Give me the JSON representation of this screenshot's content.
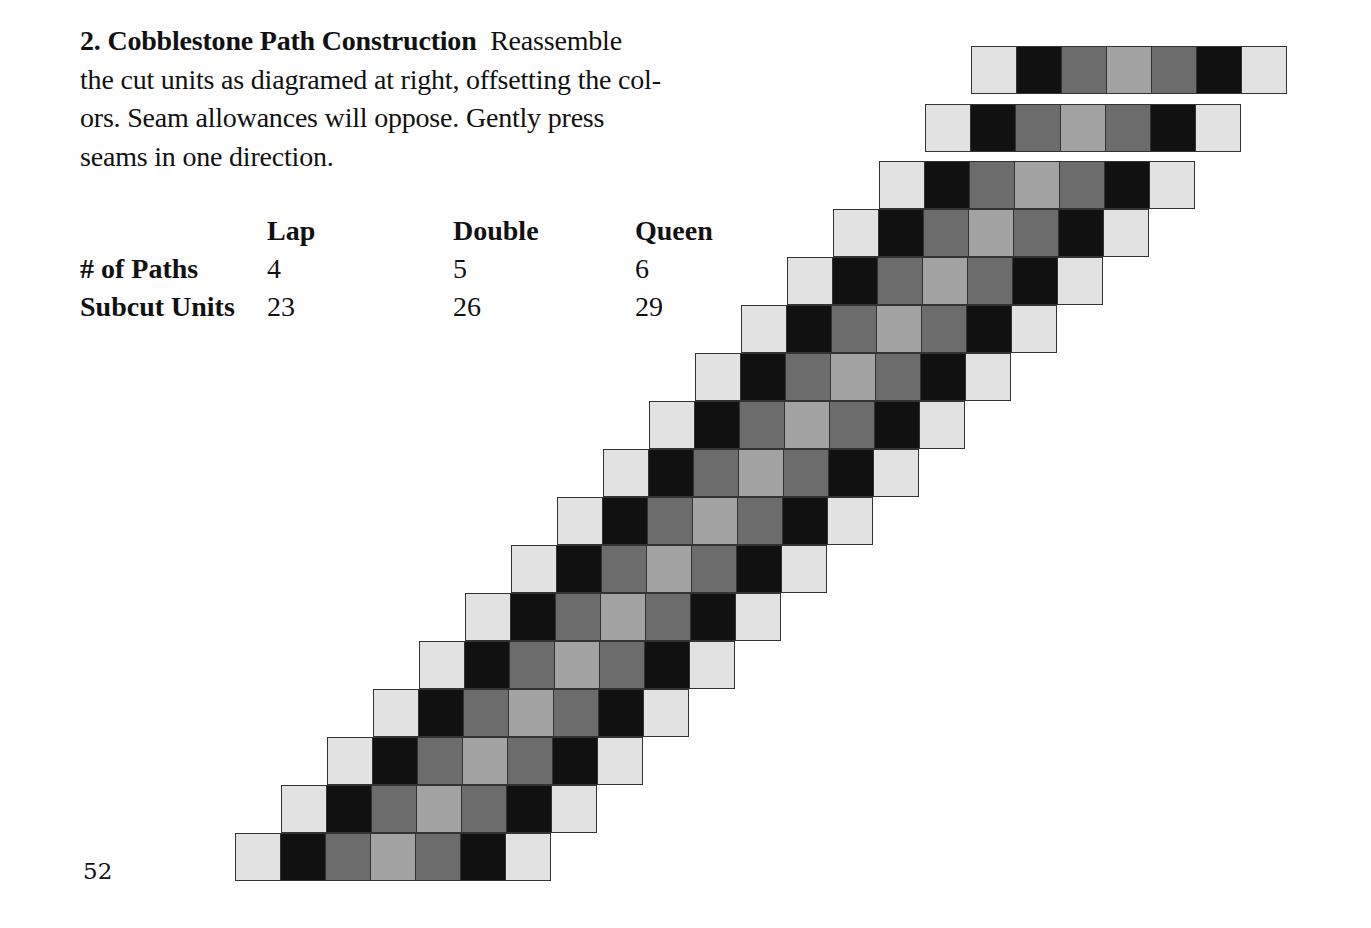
{
  "section": {
    "heading": "2.  Cobblestone Path Construction",
    "body": "Reassemble the cut units as diagramed at right, offsetting the colors.  Seam allowances will oppose.  Gently press seams in one direction.",
    "lines": [
      "Reassemble",
      "the cut units as diagramed at right, offsetting the col-",
      "ors.  Seam allowances will oppose.  Gently press",
      "seams in one direction."
    ]
  },
  "table": {
    "columns": [
      "Lap",
      "Double",
      "Queen"
    ],
    "rows": [
      {
        "label": "# of Paths",
        "values": [
          "4",
          "5",
          "6"
        ]
      },
      {
        "label": "Subcut Units",
        "values": [
          "23",
          "26",
          "29"
        ]
      }
    ]
  },
  "page_number": "52",
  "diagram": {
    "name": "cobblestone-path-diagram",
    "unit_colors": [
      "#e2e2e2",
      "#111111",
      "#6c6c6c",
      "#a3a3a3",
      "#6c6c6c",
      "#111111",
      "#e2e2e2"
    ],
    "unit_labels": [
      "light",
      "dark",
      "medium",
      "medium-light",
      "medium",
      "dark",
      "light"
    ],
    "separated_units": 2,
    "joined_units": 15
  }
}
